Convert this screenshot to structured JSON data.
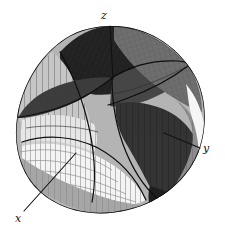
{
  "figure": {
    "title": "",
    "caption": "",
    "background_color": "#ffffff",
    "ink_color": "#111111",
    "width": 225,
    "height": 240
  },
  "axes": {
    "origin": {
      "x": 112,
      "y": 76
    },
    "labels": [
      {
        "id": "z",
        "text": "z",
        "label_x": 101,
        "label_y": 10,
        "leader_from": {
          "x": 110,
          "y": 26
        },
        "leader_to": {
          "x": 113,
          "y": 78
        },
        "description": "vertical axis rising from the centre of the solid"
      },
      {
        "id": "y",
        "text": "y",
        "label_x": 203,
        "label_y": 143,
        "leader_from": {
          "x": 200,
          "y": 148
        },
        "leader_to": {
          "x": 164,
          "y": 133
        },
        "description": "leader line pointing down-right to the right-hand lobe"
      },
      {
        "id": "x",
        "text": "x",
        "label_x": 15,
        "label_y": 213,
        "leader_from": {
          "x": 24,
          "y": 211
        },
        "leader_to": {
          "x": 76,
          "y": 153
        },
        "description": "leader line pointing down-left from the bright front lobe"
      }
    ]
  },
  "palette": {
    "highlight": "#f2f2f2",
    "light": "#d8d8d8",
    "mid_light": "#bdbdbd",
    "mid": "#9b9b9b",
    "mid_dark": "#767676",
    "dark": "#4a4a4a",
    "darker": "#303030",
    "near_black": "#1c1c1c",
    "outline": "#0d0d0d",
    "mesh_line": "#6a6a6a",
    "mesh_line_dark": "#2a2a2a"
  },
  "surfaces": [
    {
      "id": "front-bright-lobe",
      "tone": "highlight",
      "note": "large pale lobe in lower-left facing viewer, ruled with close vertical mesh lines"
    },
    {
      "id": "upper-left-cylinder-band",
      "tone": "mid_light",
      "note": "grey band sweeping over the top-left shoulder"
    },
    {
      "id": "top-dark-cap",
      "tone": "near_black",
      "note": "dark crescent across the top of the solid"
    },
    {
      "id": "upper-right-panel",
      "tone": "mid_dark",
      "note": "mid-dark mesh panel on the upper right"
    },
    {
      "id": "right-dark-lobe",
      "tone": "darker",
      "note": "dark lobe on the right where the y callout points"
    },
    {
      "id": "right-grey-flank",
      "tone": "mid",
      "note": "grey flank along the right silhouette"
    },
    {
      "id": "bottom-grey-band",
      "tone": "mid_light",
      "note": "grey band across the lower edge of the solid"
    },
    {
      "id": "central-dark-wedges",
      "tone": "dark",
      "note": "dark curved wedges converging at the origin"
    },
    {
      "id": "right-edge-highlight",
      "tone": "highlight",
      "note": "thin bright rim along the far right silhouette"
    }
  ],
  "mesh": {
    "meridian_spacing_px": 5,
    "parallel_count": 7,
    "line_color": "#6a6a6a",
    "visible": true
  }
}
